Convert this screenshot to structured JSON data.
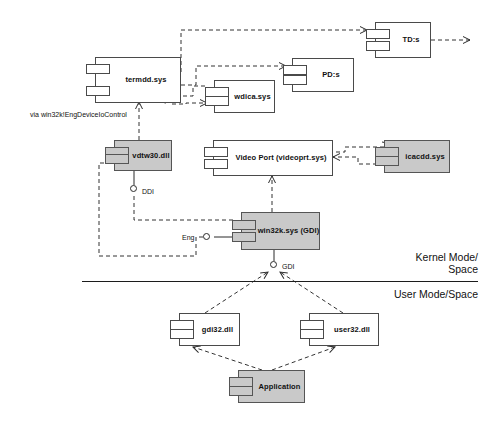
{
  "diagram": {
    "notes": [
      {
        "id": "eng-device-io",
        "text": "via win32k!EngDeviceIoControl"
      }
    ],
    "mode_labels": {
      "kernel": "Kernel Mode/\nSpace",
      "user": "User Mode/Space"
    },
    "components": [
      {
        "id": "termdd",
        "label": "termdd.sys",
        "shaded": false
      },
      {
        "id": "tds",
        "label": "TD:s",
        "shaded": false
      },
      {
        "id": "pds",
        "label": "PD:s",
        "shaded": false
      },
      {
        "id": "wdica",
        "label": "wdica.sys",
        "shaded": false
      },
      {
        "id": "vdtw30",
        "label": "vdtw30.dll",
        "shaded": true
      },
      {
        "id": "videoport",
        "label": "Video Port (videoprt.sys)",
        "shaded": false
      },
      {
        "id": "icacdd",
        "label": "icacdd.sys",
        "shaded": true
      },
      {
        "id": "win32k",
        "label": "win32k.sys (GDI)",
        "shaded": true
      },
      {
        "id": "gdi32",
        "label": "gdi32.dll",
        "shaded": false
      },
      {
        "id": "user32",
        "label": "user32.dll",
        "shaded": false
      },
      {
        "id": "application",
        "label": "Application",
        "shaded": true
      }
    ],
    "interfaces": [
      {
        "id": "ddi",
        "label": "DDI"
      },
      {
        "id": "eng",
        "label": "Eng"
      },
      {
        "id": "gdi",
        "label": "GDI"
      }
    ],
    "colors": {
      "shaded_fill": "#c9c9c9",
      "plain_fill": "#ffffff",
      "stroke": "#2b2b2b",
      "background": "#ffffff"
    }
  }
}
